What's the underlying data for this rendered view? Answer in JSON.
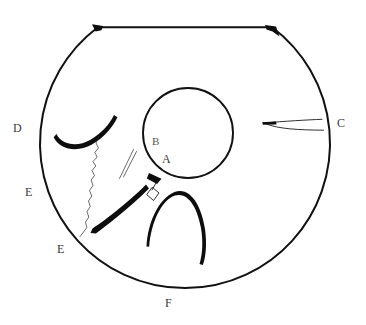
{
  "figure": {
    "background_color": "#ffffff",
    "ink_color": "#111111",
    "label_color": "#3a3a3a",
    "canvas": {
      "width": 366,
      "height": 325
    },
    "outer_body": {
      "name": "circle-with-flat-top-chord",
      "center_x": 183,
      "center_y": 155,
      "radius": 145,
      "chord_y": 27,
      "chord_x_start": 97,
      "chord_x_end": 273
    },
    "inner_circle": {
      "name": "central-circle",
      "center_x": 188,
      "center_y": 133,
      "radius": 45
    },
    "labels": [
      {
        "id": "label-A",
        "text": "A",
        "x": 162,
        "y": 153
      },
      {
        "id": "label-B",
        "text": "B",
        "x": 152,
        "y": 136
      },
      {
        "id": "label-C",
        "text": "C",
        "x": 337,
        "y": 117
      },
      {
        "id": "label-D",
        "text": "D",
        "x": 13,
        "y": 122
      },
      {
        "id": "label-E-upper",
        "text": "E",
        "x": 25,
        "y": 186
      },
      {
        "id": "label-E-lower",
        "text": "E",
        "x": 57,
        "y": 243
      },
      {
        "id": "label-F",
        "text": "F",
        "x": 165,
        "y": 297
      }
    ],
    "strokes": [
      {
        "id": "hook-curve-left",
        "description": "thick hooked curve left of centre"
      },
      {
        "id": "wavy-vertical-line",
        "description": "thin jagged line descending to lower-left rim"
      },
      {
        "id": "parallel-hairlines",
        "description": "two short thin parallel diagonal lines"
      },
      {
        "id": "diamond-tag",
        "description": "small dart and diamond hanging below central circle"
      },
      {
        "id": "thick-diagonal-stroke",
        "description": "heavy diagonal stroke lower left"
      },
      {
        "id": "inverted-u-arc",
        "description": "inverted U arc at lower centre, thick on right"
      },
      {
        "id": "wedge-sliver-right",
        "description": "narrow fork sliver near label C"
      },
      {
        "id": "chord-end-blob-left",
        "description": "dark blob at left end of top chord"
      },
      {
        "id": "chord-end-blob-right",
        "description": "dark blob at right end of top chord"
      }
    ]
  }
}
